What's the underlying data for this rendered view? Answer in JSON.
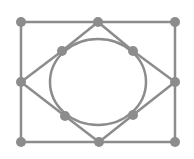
{
  "diagram": {
    "stroke_color": "#8c8c8c",
    "node_color": "#8c8c8c",
    "node_radius": 5,
    "circle": {
      "cx": 98,
      "cy": 82,
      "rx": 48,
      "ry": 43
    },
    "nodes": [
      {
        "id": "top-left",
        "x": 21,
        "y": 22
      },
      {
        "id": "top-mid",
        "x": 98,
        "y": 22
      },
      {
        "id": "top-right",
        "x": 175,
        "y": 22
      },
      {
        "id": "mid-left",
        "x": 21,
        "y": 82
      },
      {
        "id": "mid-right",
        "x": 175,
        "y": 82
      },
      {
        "id": "bottom-left",
        "x": 21,
        "y": 142
      },
      {
        "id": "bottom-mid",
        "x": 99,
        "y": 142
      },
      {
        "id": "bottom-right",
        "x": 175,
        "y": 142
      },
      {
        "id": "inner-top-left",
        "x": 62,
        "y": 51
      },
      {
        "id": "inner-top-right",
        "x": 133,
        "y": 51
      },
      {
        "id": "inner-bottom-left",
        "x": 65,
        "y": 116
      },
      {
        "id": "inner-bottom-right",
        "x": 133,
        "y": 115
      }
    ],
    "edges": [
      [
        "top-left",
        "top-mid"
      ],
      [
        "top-mid",
        "top-right"
      ],
      [
        "bottom-left",
        "bottom-mid"
      ],
      [
        "bottom-mid",
        "bottom-right"
      ],
      [
        "top-left",
        "mid-left"
      ],
      [
        "mid-left",
        "bottom-left"
      ],
      [
        "top-right",
        "mid-right"
      ],
      [
        "mid-right",
        "bottom-right"
      ],
      [
        "top-mid",
        "inner-top-left"
      ],
      [
        "inner-top-left",
        "mid-left"
      ],
      [
        "top-mid",
        "inner-top-right"
      ],
      [
        "inner-top-right",
        "mid-right"
      ],
      [
        "mid-left",
        "inner-bottom-left"
      ],
      [
        "inner-bottom-left",
        "bottom-mid"
      ],
      [
        "mid-right",
        "inner-bottom-right"
      ],
      [
        "inner-bottom-right",
        "bottom-mid"
      ]
    ]
  }
}
